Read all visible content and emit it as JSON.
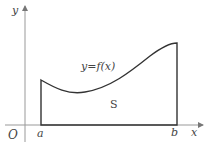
{
  "diagram": {
    "labels": {
      "y_axis": "y",
      "x_axis": "x",
      "origin": "O",
      "a": "a",
      "b": "b",
      "function": "y=f(x)",
      "area": "S"
    },
    "colors": {
      "axis": "#999999",
      "curve": "#333333",
      "text": "#444444"
    }
  }
}
